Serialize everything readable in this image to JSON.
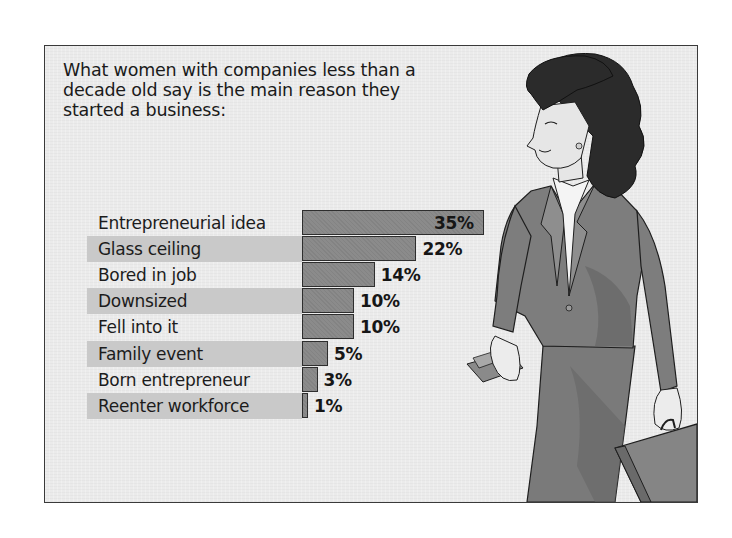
{
  "title_lines": [
    "What women with companies less than a",
    "decade old say is the main reason they",
    "started a business:"
  ],
  "illustration": {
    "subject": "businesswoman walking with briefcase and wallet",
    "colors": {
      "hair": "#2b2b2b",
      "suit": "#7d7d7d",
      "suit_shadow": "#666666",
      "skin": "#e6e6e6",
      "shirt": "#f4f4f4",
      "outline": "#1e1e1e"
    }
  },
  "colors": {
    "frame_border": "#3a3a3a",
    "background": "#ebebeb",
    "stripe": "#c9c9c9",
    "bar_fill": "#8b8b8b",
    "bar_border": "#2e2e2e",
    "text": "#1a1a1a"
  },
  "chart_data": {
    "type": "bar",
    "orientation": "horizontal",
    "title": "What women with companies less than a decade old say is the main reason they started a business:",
    "categories": [
      "Entrepreneurial idea",
      "Glass ceiling",
      "Bored in job",
      "Downsized",
      "Fell into it",
      "Family event",
      "Born entrepreneur",
      "Reenter workforce"
    ],
    "values": [
      35,
      22,
      14,
      10,
      10,
      5,
      3,
      1
    ],
    "value_labels": [
      "35%",
      "22%",
      "14%",
      "10%",
      "10%",
      "5%",
      "3%",
      "1%"
    ],
    "unit": "%",
    "xlabel": "",
    "ylabel": "",
    "xlim": [
      0,
      35
    ],
    "grid": false,
    "legend": null,
    "row_striping": "alternating grey bands behind labels"
  }
}
